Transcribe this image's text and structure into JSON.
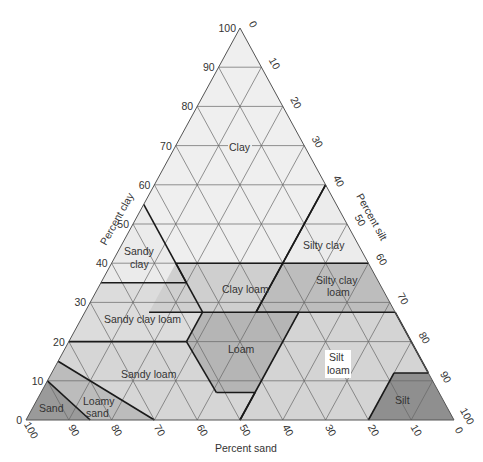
{
  "chart_data": {
    "type": "ternary",
    "axes": {
      "clay": {
        "label": "Percent clay",
        "ticks": [
          0,
          10,
          20,
          30,
          40,
          50,
          60,
          70,
          80,
          90,
          100
        ]
      },
      "silt": {
        "label": "Percent silt",
        "ticks": [
          0,
          10,
          20,
          30,
          40,
          50,
          60,
          70,
          80,
          90,
          100
        ]
      },
      "sand": {
        "label": "Percent sand",
        "ticks": [
          100,
          90,
          80,
          70,
          60,
          50,
          40,
          30,
          20,
          10,
          0
        ]
      }
    },
    "grid": true,
    "regions": [
      {
        "name": "Clay",
        "label": "Clay",
        "fill": "#efefef",
        "points": [
          [
            40,
            0
          ],
          [
            100,
            0
          ],
          [
            0,
            0
          ]
        ],
        "label_pos": [
          70,
          20
        ]
      },
      {
        "name": "Sandy clay",
        "label": "Sandy clay",
        "fill": "#ebebeb"
      },
      {
        "name": "Silty clay",
        "label": "Silty clay",
        "fill": "#ececec"
      },
      {
        "name": "Sandy clay loam",
        "label": "Sandy clay loam",
        "fill": "#dcdcdc"
      },
      {
        "name": "Clay loam",
        "label": "Clay loam",
        "fill": "#cfcfcf"
      },
      {
        "name": "Silty clay loam",
        "label": "Silty clay loam",
        "fill": "#bdbdbd"
      },
      {
        "name": "Sandy loam",
        "label": "Sandy loam",
        "fill": "#d6d6d6"
      },
      {
        "name": "Loam",
        "label": "Loam",
        "fill": "#b5b5b5"
      },
      {
        "name": "Silt loam",
        "label": "Silt loam",
        "fill": "#d4d4d4"
      },
      {
        "name": "Silt",
        "label": "Silt",
        "fill": "#8f8f8f"
      },
      {
        "name": "Loamy sand",
        "label": "Loamy sand",
        "fill": "#bcbcbc"
      },
      {
        "name": "Sand",
        "label": "Sand",
        "fill": "#9a9a9a"
      }
    ]
  },
  "labels": {
    "clay_axis": "Percent clay",
    "silt_axis": "Percent silt",
    "sand_axis": "Percent sand",
    "regions": {
      "clay": "Clay",
      "sandy_clay_1": "Sandy",
      "sandy_clay_2": "clay",
      "silty_clay": "Silty clay",
      "sandy_clay_loam": "Sandy clay loam",
      "clay_loam": "Clay loam",
      "silty_clay_loam_1": "Silty clay",
      "silty_clay_loam_2": "loam",
      "sandy_loam": "Sandy  loam",
      "loam": "Loam",
      "silt_loam_1": "Silt",
      "silt_loam_2": "loam",
      "silt": "Silt",
      "loamy_sand_1": "Loamy",
      "loamy_sand_2": "sand",
      "sand": "Sand"
    }
  },
  "colors": {
    "outline": "#555555",
    "grid": "#666666",
    "boundary": "#1a1a1a"
  }
}
